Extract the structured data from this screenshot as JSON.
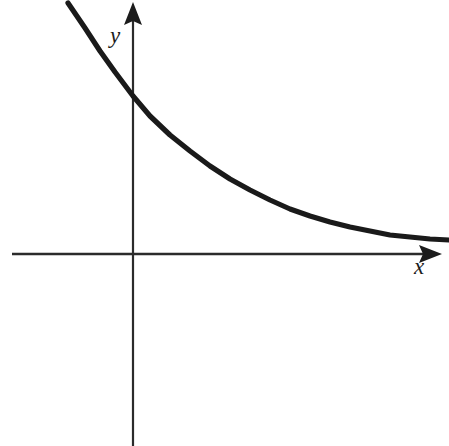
{
  "figure": {
    "name": "exponential-decay-graph",
    "background_color": "#ffffff",
    "width": 449,
    "height": 446
  },
  "axes": {
    "x_axis": {
      "label": "x",
      "color": "#2b2b2b",
      "stroke_width": 2.6,
      "origin_y": 254,
      "start_x": 12,
      "end_x": 442,
      "arrow": "right-arrow-icon"
    },
    "y_axis": {
      "label": "y",
      "color": "#2b2b2b",
      "stroke_width": 2.2,
      "origin_x": 133,
      "start_y": 446,
      "end_y": 2,
      "arrow": "up-arrow-icon"
    }
  },
  "chart_data": {
    "type": "line",
    "title": "",
    "xlabel": "x",
    "ylabel": "y",
    "grid": false,
    "legend": null,
    "curve_color": "#1a1a1a",
    "curve_stroke_width": 5.2,
    "series": [
      {
        "name": "exponential-decay",
        "points_px": [
          [
            68,
            3
          ],
          [
            85,
            28
          ],
          [
            100,
            51
          ],
          [
            115,
            72
          ],
          [
            133,
            96
          ],
          [
            150,
            116
          ],
          [
            170,
            135
          ],
          [
            190,
            151
          ],
          [
            210,
            166
          ],
          [
            230,
            179
          ],
          [
            250,
            190
          ],
          [
            270,
            200
          ],
          [
            290,
            209
          ],
          [
            310,
            216
          ],
          [
            330,
            222
          ],
          [
            350,
            227
          ],
          [
            370,
            231
          ],
          [
            390,
            235
          ],
          [
            410,
            237
          ],
          [
            430,
            239
          ],
          [
            449,
            240
          ]
        ]
      }
    ],
    "axis_ranges": {
      "x_visible_px": [
        12,
        442
      ],
      "y_visible_px": [
        2,
        446
      ]
    }
  }
}
